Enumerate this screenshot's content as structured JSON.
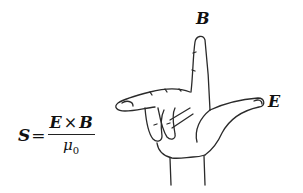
{
  "diagram": {
    "formula": {
      "lhs": "S",
      "equals": "=",
      "numerator_left": "E",
      "operator": "×",
      "numerator_right": "B",
      "denominator_symbol": "μ",
      "denominator_subscript": "0"
    },
    "labels": {
      "up_finger": "B",
      "thumb": "E"
    },
    "hand": {
      "index_finger_direction": "up (B)",
      "thumb_direction": "right (E)",
      "middle_finger_direction": "left/toward viewer (S)"
    },
    "colors": {
      "line": "#2a2a2a",
      "background": "#ffffff",
      "text": "#111111"
    }
  }
}
